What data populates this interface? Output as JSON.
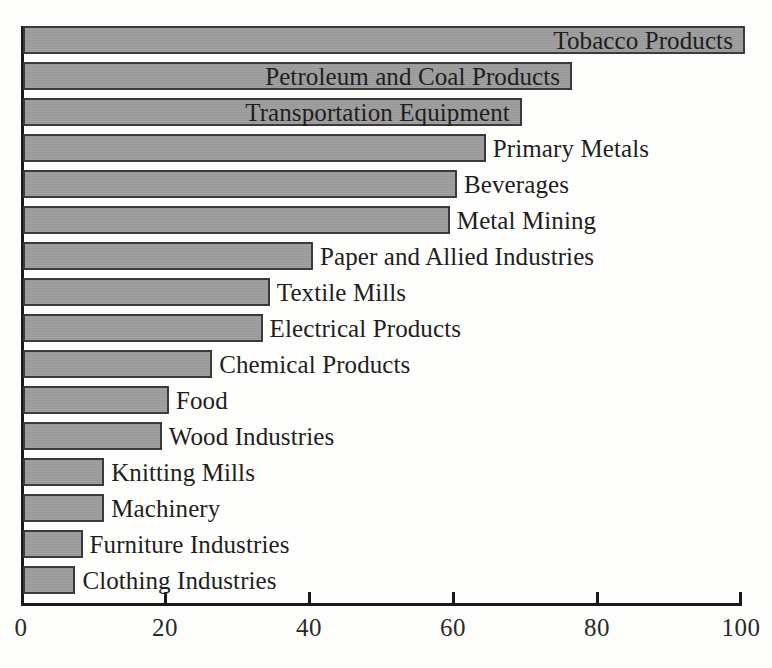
{
  "chart_data": {
    "type": "bar",
    "orientation": "horizontal",
    "title": "",
    "subtitle": "",
    "xlabel": "",
    "ylabel": "",
    "xlim": [
      0,
      100
    ],
    "xticks": [
      0,
      20,
      40,
      60,
      80,
      100
    ],
    "xtick_labels": [
      "0",
      "20",
      "40",
      "60",
      "80",
      "100"
    ],
    "grid": false,
    "legend": false,
    "bar_color": "#9b9b9b",
    "bar_edge_color": "#3a3a3a",
    "axis_color": "#1a1a1a",
    "background_color": "#fdfdfb",
    "categories": [
      "Tobacco Products",
      "Petroleum and Coal Products",
      "Transportation Equipment",
      "Primary Metals",
      "Beverages",
      "Metal Mining",
      "Paper and Allied Industries",
      "Textile Mills",
      "Electrical Products",
      "Chemical Products",
      "Food",
      "Wood Industries",
      "Knitting Mills",
      "Machinery",
      "Furniture Industries",
      "Clothing Industries"
    ],
    "values": [
      100,
      76,
      69,
      64,
      60,
      59,
      40,
      34,
      33,
      26,
      20,
      19,
      11,
      11,
      8,
      7
    ],
    "label_placement": [
      "inside",
      "inside",
      "inside",
      "outside",
      "outside",
      "outside",
      "outside",
      "outside",
      "outside",
      "outside",
      "outside",
      "outside",
      "outside",
      "outside",
      "outside",
      "outside"
    ]
  }
}
